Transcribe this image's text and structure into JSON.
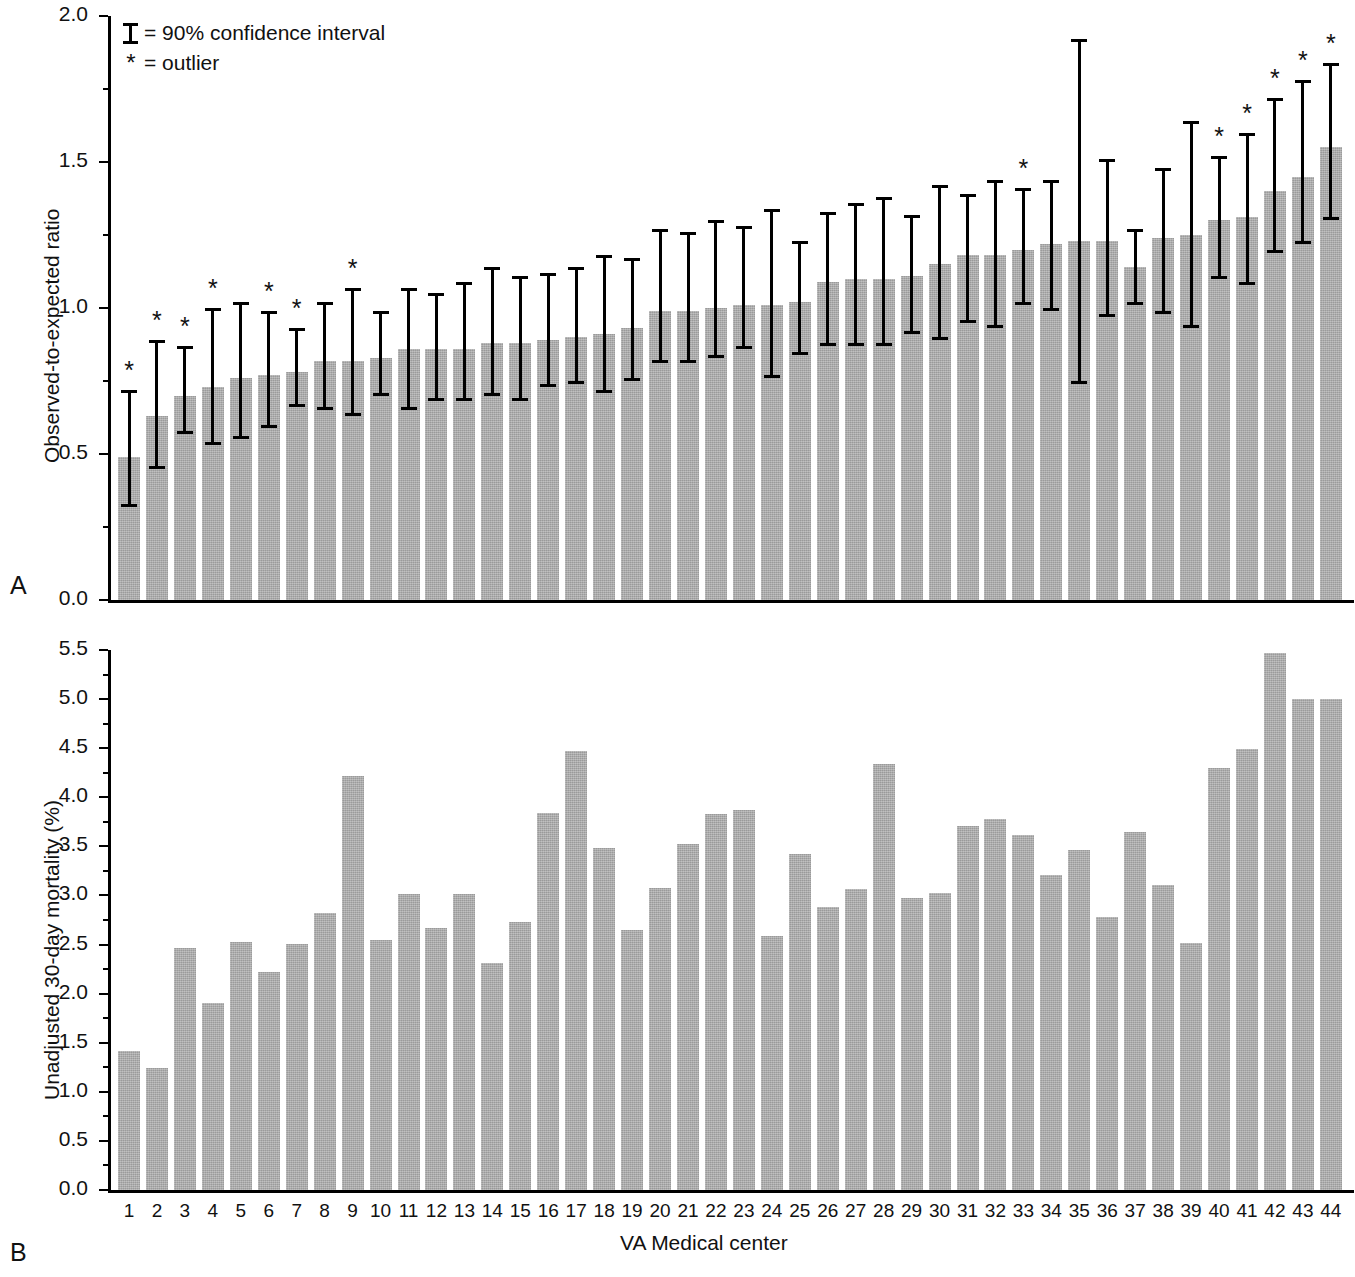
{
  "figure": {
    "panel_a_label": "A",
    "panel_b_label": "B",
    "legend": {
      "ci_glyph": "error-bar-glyph",
      "ci_text": "= 90% confidence interval",
      "outlier_glyph": "*",
      "outlier_text": "= outlier"
    }
  },
  "chart_data": [
    {
      "type": "bar",
      "panel": "A",
      "title": "",
      "xlabel": "",
      "ylabel": "Observed-to-expected ratio",
      "ylim": [
        0.0,
        2.0
      ],
      "ytick_labels": [
        "0.0",
        "0.5",
        "1.0",
        "1.5",
        "2.0"
      ],
      "ytick_values": [
        0.0,
        0.5,
        1.0,
        1.5,
        2.0
      ],
      "yminor_step": 0.25,
      "grid": false,
      "legend_position": "top-left",
      "bar_color": "#a9a9a9",
      "errorbar_label": "90% confidence interval",
      "categories": [
        1,
        2,
        3,
        4,
        5,
        6,
        7,
        8,
        9,
        10,
        11,
        12,
        13,
        14,
        15,
        16,
        17,
        18,
        19,
        20,
        21,
        22,
        23,
        24,
        25,
        26,
        27,
        28,
        29,
        30,
        31,
        32,
        33,
        34,
        35,
        36,
        37,
        38,
        39,
        40,
        41,
        42,
        43,
        44
      ],
      "values": [
        0.49,
        0.63,
        0.7,
        0.73,
        0.76,
        0.77,
        0.78,
        0.82,
        0.82,
        0.83,
        0.86,
        0.86,
        0.86,
        0.88,
        0.88,
        0.89,
        0.9,
        0.91,
        0.93,
        0.99,
        0.99,
        1.0,
        1.01,
        1.01,
        1.02,
        1.09,
        1.1,
        1.1,
        1.11,
        1.15,
        1.18,
        1.18,
        1.2,
        1.22,
        1.23,
        1.23,
        1.14,
        1.24,
        1.25,
        1.3,
        1.31,
        1.4,
        1.45,
        1.55
      ],
      "ci_lower": [
        0.32,
        0.45,
        0.57,
        0.53,
        0.55,
        0.59,
        0.66,
        0.65,
        0.63,
        0.7,
        0.65,
        0.68,
        0.68,
        0.7,
        0.68,
        0.73,
        0.74,
        0.71,
        0.75,
        0.81,
        0.81,
        0.83,
        0.86,
        0.76,
        0.84,
        0.87,
        0.87,
        0.87,
        0.91,
        0.89,
        0.95,
        0.93,
        1.01,
        0.99,
        0.74,
        0.97,
        1.01,
        0.98,
        0.93,
        1.1,
        1.08,
        1.19,
        1.22,
        1.3
      ],
      "ci_upper": [
        0.72,
        0.89,
        0.87,
        1.0,
        1.02,
        0.99,
        0.93,
        1.02,
        1.07,
        0.99,
        1.07,
        1.05,
        1.09,
        1.14,
        1.11,
        1.12,
        1.14,
        1.18,
        1.17,
        1.27,
        1.26,
        1.3,
        1.28,
        1.34,
        1.23,
        1.33,
        1.36,
        1.38,
        1.32,
        1.42,
        1.39,
        1.44,
        1.41,
        1.44,
        1.92,
        1.51,
        1.27,
        1.48,
        1.64,
        1.52,
        1.6,
        1.72,
        1.78,
        1.84
      ],
      "outliers": [
        1,
        2,
        3,
        4,
        6,
        7,
        9,
        33,
        40,
        41,
        42,
        43,
        44
      ]
    },
    {
      "type": "bar",
      "panel": "B",
      "title": "",
      "xlabel": "VA Medical center",
      "ylabel": "Unadjusted 30-day mortality (%)",
      "ylim": [
        0.0,
        5.5
      ],
      "ytick_labels": [
        "0.0",
        "0.5",
        "1.0",
        "1.5",
        "2.0",
        "2.5",
        "3.0",
        "3.5",
        "4.0",
        "4.5",
        "5.0",
        "5.5"
      ],
      "ytick_values": [
        0.0,
        0.5,
        1.0,
        1.5,
        2.0,
        2.5,
        3.0,
        3.5,
        4.0,
        4.5,
        5.0,
        5.5
      ],
      "yminor_step": 0.25,
      "grid": false,
      "bar_color": "#a9a9a9",
      "categories": [
        1,
        2,
        3,
        4,
        5,
        6,
        7,
        8,
        9,
        10,
        11,
        12,
        13,
        14,
        15,
        16,
        17,
        18,
        19,
        20,
        21,
        22,
        23,
        24,
        25,
        26,
        27,
        28,
        29,
        30,
        31,
        32,
        33,
        34,
        35,
        36,
        37,
        38,
        39,
        40,
        41,
        42,
        43,
        44
      ],
      "values": [
        1.42,
        1.24,
        2.46,
        1.9,
        2.53,
        2.22,
        2.51,
        2.82,
        4.22,
        2.55,
        3.01,
        2.67,
        3.01,
        2.31,
        2.73,
        3.84,
        4.47,
        3.48,
        2.65,
        3.08,
        3.52,
        3.83,
        3.87,
        2.59,
        3.42,
        2.88,
        3.07,
        4.34,
        2.97,
        3.03,
        3.71,
        3.78,
        3.62,
        3.21,
        3.46,
        2.78,
        3.65,
        3.11,
        2.52,
        4.3,
        4.49,
        5.47,
        5.0,
        5.0
      ]
    }
  ],
  "axis": {
    "x_tick_labels": [
      "1",
      "2",
      "3",
      "4",
      "5",
      "6",
      "7",
      "8",
      "9",
      "10",
      "11",
      "12",
      "13",
      "14",
      "15",
      "16",
      "17",
      "18",
      "19",
      "20",
      "21",
      "22",
      "23",
      "24",
      "25",
      "26",
      "27",
      "28",
      "29",
      "30",
      "31",
      "32",
      "33",
      "34",
      "35",
      "36",
      "37",
      "38",
      "39",
      "40",
      "41",
      "42",
      "43",
      "44"
    ],
    "x_title": "VA Medical center"
  }
}
